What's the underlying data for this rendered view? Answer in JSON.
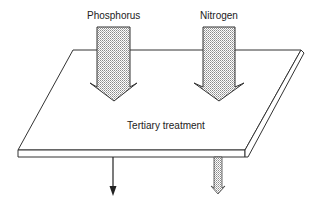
{
  "diagram": {
    "inputs": [
      {
        "label": "Phosphorus"
      },
      {
        "label": "Nitrogen"
      }
    ],
    "process": {
      "label": "Tertiary treatment"
    },
    "outputs": [
      {
        "style": "thin-arrow"
      },
      {
        "style": "small-dotted-arrow"
      }
    ],
    "colors": {
      "line": "#222222",
      "fill_pattern": "#9a9a9a",
      "background": "#ffffff"
    }
  }
}
